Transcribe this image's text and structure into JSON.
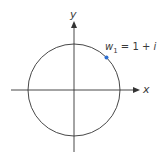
{
  "diagram": {
    "type": "complex-plane-unit-circle",
    "axes": {
      "x_label": "x",
      "y_label": "y"
    },
    "circle": {
      "center": [
        0,
        0
      ],
      "passes_through": "w1"
    },
    "point": {
      "name": "w1",
      "label_var": "w",
      "label_sub": "1",
      "label_rest": " = 1 + ",
      "label_imag": "i",
      "color": "#2e6fd0",
      "angle_deg": 45
    },
    "colors": {
      "axis": "#333333",
      "circle": "#333333",
      "text": "#3a3a3a"
    }
  }
}
